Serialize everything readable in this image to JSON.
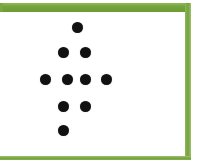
{
  "figure": {
    "title": "",
    "background_color": "#ffffff",
    "frame": {
      "name": "green-rectangular-border",
      "color": "#7aa840",
      "top_thickness_px": 9,
      "side_thickness_px": 6,
      "bottom_thickness_px": 4,
      "left_edge_open": true
    },
    "dot_color": "#111111",
    "dot_diameter_px": 11,
    "shape_description": "arrow-like dot pattern"
  },
  "chart_data": {
    "type": "scatter",
    "title": "",
    "xlabel": "",
    "ylabel": "",
    "xlim": [
      0,
      185
    ],
    "ylim": [
      0,
      144
    ],
    "grid": false,
    "legend": null,
    "marker": "circle",
    "marker_color": "#111111",
    "marker_size_px": 11,
    "point_count": 10,
    "rows": [
      {
        "row": 1,
        "count": 1,
        "cx": [
          77
        ],
        "cy": 27
      },
      {
        "row": 2,
        "count": 2,
        "cx": [
          63,
          85
        ],
        "cy": 52
      },
      {
        "row": 3,
        "count": 4,
        "cx": [
          45,
          67,
          85,
          106
        ],
        "cy": 79
      },
      {
        "row": 4,
        "count": 2,
        "cx": [
          63,
          85
        ],
        "cy": 106
      },
      {
        "row": 5,
        "count": 1,
        "cx": [
          63
        ],
        "cy": 130
      }
    ],
    "points": [
      {
        "x": 77,
        "y": 27
      },
      {
        "x": 63,
        "y": 52
      },
      {
        "x": 85,
        "y": 52
      },
      {
        "x": 45,
        "y": 79
      },
      {
        "x": 67,
        "y": 79
      },
      {
        "x": 85,
        "y": 79
      },
      {
        "x": 106,
        "y": 79
      },
      {
        "x": 63,
        "y": 106
      },
      {
        "x": 85,
        "y": 106
      },
      {
        "x": 63,
        "y": 130
      }
    ]
  }
}
